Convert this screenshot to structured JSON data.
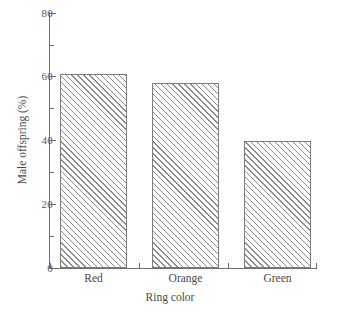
{
  "chart_data": {
    "type": "bar",
    "title": "",
    "subtitle": "",
    "categories": [
      "Red",
      "Orange",
      "Green"
    ],
    "values": [
      61,
      58,
      40
    ],
    "series": [
      {
        "name": "Male offspring (%)",
        "values": [
          61,
          58,
          40
        ]
      }
    ],
    "xlabel": "Ring color",
    "ylabel": "Male offspring (%)",
    "ylim": [
      0,
      80
    ],
    "ytick_labels": [
      "0",
      "20",
      "40",
      "60",
      "80"
    ],
    "ytick_values": [
      0,
      20,
      40,
      60,
      80
    ],
    "yminor_tick_values": [
      10,
      30,
      50,
      70
    ],
    "grid": false,
    "legend": null,
    "annotations": [],
    "bar_style": {
      "fill": "#ffffff",
      "hatch": "diagonal-forward-slash",
      "hatch_color": "#8a8a8a",
      "edge_color": "#7d7d7d"
    },
    "axis_color": "#6e6e6e",
    "background": "#ffffff"
  },
  "axes": {
    "y_title": "Male offspring (%)",
    "x_title": "Ring color",
    "y_ticks": [
      {
        "label": "80",
        "value": 80
      },
      {
        "label": "60",
        "value": 60
      },
      {
        "label": "40",
        "value": 40
      },
      {
        "label": "20",
        "value": 20
      },
      {
        "label": "0",
        "value": 0
      }
    ],
    "x_ticks": [
      {
        "label": "Red"
      },
      {
        "label": "Orange"
      },
      {
        "label": "Green"
      }
    ]
  }
}
